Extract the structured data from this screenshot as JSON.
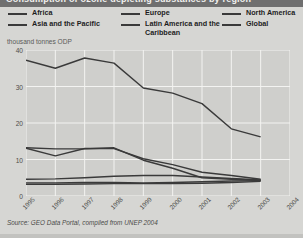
{
  "figure": {
    "cropped_title": "Consumption of ozone depleting substances by region",
    "unit_caption": "thousand tonnes ODP",
    "source": "Source: GEO Data Portal, compiled from UNEP 2004",
    "line_color": "#3a3a3a",
    "plot_bg": "#cfcfcc",
    "page_bg": "#d6d6d3"
  },
  "legend": {
    "columns": [
      {
        "items": [
          {
            "label": "Africa"
          },
          {
            "label": "Asia and the Pacific"
          }
        ]
      },
      {
        "items": [
          {
            "label": "Europe"
          },
          {
            "label": "Latin America and the Caribbean"
          }
        ]
      },
      {
        "items": [
          {
            "label": "North America"
          },
          {
            "label": "Global"
          }
        ]
      }
    ]
  },
  "chart_data": {
    "type": "line",
    "title": "Consumption of ozone depleting substances by region",
    "xlabel": "",
    "ylabel": "thousand tonnes ODP",
    "unit": "thousand tonnes ODP",
    "x": [
      1995,
      1996,
      1997,
      1998,
      1999,
      2000,
      2001,
      2002,
      2003
    ],
    "xtick_labels": [
      "1995",
      "1996",
      "1997",
      "1998",
      "1999",
      "2000",
      "2001",
      "2002",
      "2003",
      "2004"
    ],
    "ytick_labels": [
      "0",
      "10",
      "20",
      "30",
      "40"
    ],
    "yticks": [
      0,
      10,
      20,
      30,
      40
    ],
    "ylim": [
      0,
      40
    ],
    "xlim": [
      1995,
      2004
    ],
    "grid": true,
    "legend_position": "top",
    "series": [
      {
        "name": "Global",
        "values": [
          37.2,
          35.0,
          37.8,
          36.4,
          29.6,
          28.2,
          25.3,
          18.4,
          16.2
        ]
      },
      {
        "name": "Asia and the Pacific",
        "values": [
          13.1,
          11.0,
          13.0,
          13.0,
          10.2,
          8.6,
          6.5,
          5.6,
          4.6
        ]
      },
      {
        "name": "Latin America and the Caribbean",
        "values": [
          4.6,
          4.7,
          5.0,
          5.4,
          5.6,
          5.6,
          5.2,
          4.8,
          4.4
        ]
      },
      {
        "name": "Europe",
        "values": [
          13.2,
          12.9,
          12.9,
          13.2,
          9.8,
          7.6,
          5.0,
          4.6,
          4.3
        ]
      },
      {
        "name": "Africa",
        "values": [
          3.6,
          3.6,
          3.7,
          3.7,
          3.6,
          3.7,
          3.9,
          4.1,
          4.2
        ]
      },
      {
        "name": "North America",
        "values": [
          3.2,
          3.2,
          3.3,
          3.4,
          3.4,
          3.4,
          3.5,
          3.7,
          4.0
        ]
      }
    ]
  }
}
